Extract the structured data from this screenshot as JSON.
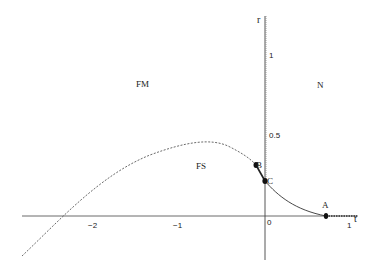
{
  "diagram": {
    "axes": {
      "horizontal": {
        "name": "t",
        "ticks": [
          {
            "label": "−2",
            "value": -2
          },
          {
            "label": "−1",
            "value": -1
          },
          {
            "label": "0",
            "value": 0
          },
          {
            "label": "1",
            "value": 1
          }
        ]
      },
      "vertical": {
        "name": "r",
        "ticks": [
          {
            "label": "0.5",
            "value": 0.5
          },
          {
            "label": "1",
            "value": 1
          }
        ]
      }
    },
    "regions": [
      {
        "label": "FM"
      },
      {
        "label": "N"
      },
      {
        "label": "FS"
      }
    ],
    "points": [
      {
        "label": "A"
      },
      {
        "label": "B"
      },
      {
        "label": "C"
      }
    ],
    "colors": {
      "line": "#333333",
      "background": "#ffffff"
    }
  }
}
